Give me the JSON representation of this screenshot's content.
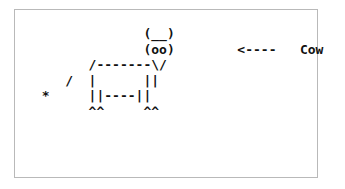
{
  "window": {
    "background_color": "#ffffff",
    "frame_color": "#b9b9b9",
    "text_color": "#111111"
  },
  "art": {
    "title": "ASCII art cow with label",
    "label_text": "Cow",
    "arrow_text": "<----",
    "lines": [
      "               (__)",
      "               (oo)        <----   Cow",
      "        /-------\\/",
      "     /  |      ||",
      "  *     ||----||",
      "        ^^     ^^"
    ],
    "line_0": "               (__)",
    "line_1": "               (oo)        <----   Cow",
    "line_2": "        /-------\\/",
    "line_3": "     /  |      ||",
    "line_4": "  *     ||----||",
    "line_5": "        ^^     ^^"
  }
}
